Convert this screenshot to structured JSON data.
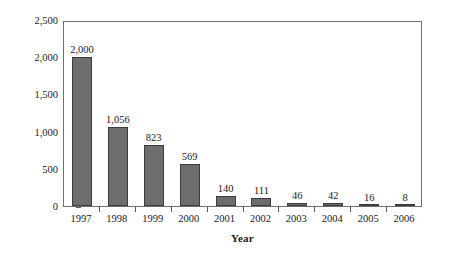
{
  "chart_data": {
    "type": "bar",
    "title": "",
    "xlabel": "Year",
    "ylabel": "Parts Per Million",
    "categories": [
      "1997",
      "1998",
      "1999",
      "2000",
      "2001",
      "2002",
      "2003",
      "2004",
      "2005",
      "2006"
    ],
    "values": [
      2000,
      1056,
      823,
      569,
      140,
      111,
      46,
      42,
      16,
      8
    ],
    "value_labels": [
      "2,000",
      "1,056",
      "823",
      "569",
      "140",
      "111",
      "46",
      "42",
      "16",
      "8"
    ],
    "ylim": [
      0,
      2500
    ],
    "y_ticks": [
      0,
      500,
      1000,
      1500,
      2000,
      2500
    ],
    "y_tick_labels": [
      "0",
      "500",
      "1,000",
      "1,500",
      "2,000",
      "2,500"
    ],
    "grid": false,
    "legend": false,
    "bar_color": "#6d6d6d",
    "bar_border_color": "#3c3c3c",
    "axis_color": "#6f6f6f",
    "text_color": "#1a1a1a"
  }
}
